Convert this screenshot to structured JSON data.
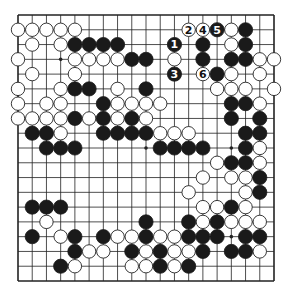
{
  "diagram": {
    "type": "go-board",
    "size": 19,
    "colors": {
      "background": "#ffffff",
      "line": "#222222",
      "black": "#1a1a1a",
      "white": "#ffffff"
    },
    "star_points": [
      [
        3,
        3
      ],
      [
        3,
        9
      ],
      [
        3,
        15
      ],
      [
        9,
        3
      ],
      [
        9,
        9
      ],
      [
        9,
        15
      ],
      [
        15,
        3
      ],
      [
        15,
        9
      ],
      [
        15,
        15
      ]
    ],
    "rows": [
      "...................",
      "WWWWW..........WB..",
      ".W.WBBBB.....B.WB..",
      "W...WWWWBB.W.B.BBWW",
      ".W..W.........BW.W.",
      "W..WBB.W.B....WWW.W",
      "W.WW..BWWWW....BBW.",
      "WWWWBWBWBW.....B.B.",
      ".BBW..BBBBWWW...BB.",
      "..BBB.....BBBB..BW.",
      "..............WBBW.",
      ".............W.WWB.",
      "............W...WB.",
      ".BBB.........WWBW..",
      "..W......B..BWBWWW.",
      ".B.WB.BWWBWWBBB.BB.",
      "....BWW.BWBWWB.BBW.",
      "...BW...WWBWB......",
      "..................."
    ],
    "numbered_stones": [
      {
        "label": "1",
        "color": "B",
        "row": 2,
        "col": 11
      },
      {
        "label": "2",
        "color": "W",
        "row": 1,
        "col": 12
      },
      {
        "label": "3",
        "color": "B",
        "row": 4,
        "col": 11
      },
      {
        "label": "4",
        "color": "W",
        "row": 1,
        "col": 13
      },
      {
        "label": "5",
        "color": "B",
        "row": 1,
        "col": 14
      },
      {
        "label": "6",
        "color": "W",
        "row": 4,
        "col": 13
      }
    ]
  }
}
